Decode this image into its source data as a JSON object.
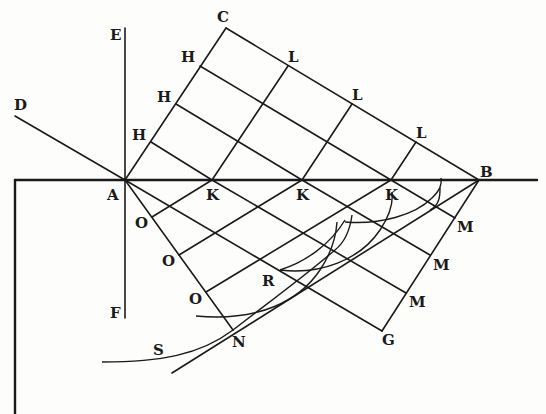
{
  "diagram": {
    "labels": {
      "C": "C",
      "E": "E",
      "D": "D",
      "A": "A",
      "B": "B",
      "F": "F",
      "G": "G",
      "N": "N",
      "R": "R",
      "S": "S",
      "H1": "H",
      "H2": "H",
      "H3": "H",
      "L1": "L",
      "L2": "L",
      "L3": "L",
      "K1": "K",
      "K2": "K",
      "K3": "K",
      "O1": "O",
      "O2": "O",
      "O3": "O",
      "M1": "M",
      "M2": "M",
      "M3": "M"
    },
    "points": {
      "A": [
        125,
        180
      ],
      "B": [
        479,
        180
      ],
      "C": [
        226,
        28
      ],
      "D": [
        15,
        116
      ],
      "E": [
        125,
        28
      ],
      "F": [
        125,
        318
      ],
      "G": [
        382,
        331
      ],
      "N": [
        233,
        330
      ]
    },
    "colors": {
      "ink": "#1a1a1a",
      "paper": "#fdfdfc"
    }
  }
}
